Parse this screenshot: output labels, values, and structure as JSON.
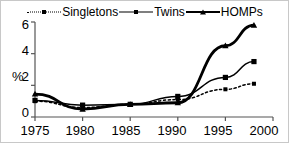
{
  "chart_data": {
    "type": "line",
    "title": "",
    "subtitle": "",
    "xlabel": "",
    "ylabel": "%",
    "x": [
      1975,
      1980,
      1985,
      1990,
      1995,
      1998
    ],
    "xlim": [
      1975,
      2000
    ],
    "ylim": [
      0,
      6
    ],
    "xticks": [
      1975,
      1980,
      1985,
      1990,
      1995,
      2000
    ],
    "yticks": [
      0,
      2,
      4,
      6
    ],
    "grid": false,
    "legend_position": "top-center",
    "series": [
      {
        "name": "Singletons",
        "values": [
          1.0,
          0.6,
          0.8,
          1.1,
          1.75,
          2.1
        ],
        "line_style": "dotted",
        "marker": "square",
        "color": "#000000"
      },
      {
        "name": "Twins",
        "values": [
          1.05,
          0.75,
          0.8,
          1.3,
          2.5,
          3.5
        ],
        "line_style": "solid-thin",
        "marker": "square",
        "color": "#000000"
      },
      {
        "name": "HOMPs",
        "values": [
          1.45,
          0.5,
          0.8,
          0.9,
          4.5,
          5.8
        ],
        "line_style": "solid-thick",
        "marker": "triangle",
        "color": "#000000"
      }
    ]
  },
  "legend": {
    "items": [
      {
        "label": "Singletons",
        "style": "dotted",
        "marker": "square"
      },
      {
        "label": "Twins",
        "style": "solid-thin",
        "marker": "square"
      },
      {
        "label": "HOMPs",
        "style": "solid-thick",
        "marker": "triangle"
      }
    ]
  },
  "axes": {
    "y_label": "%",
    "y_ticks": [
      "0",
      "2",
      "4",
      "6"
    ],
    "x_ticks": [
      "1975",
      "1980",
      "1985",
      "1990",
      "1995",
      "2000"
    ]
  },
  "colors": {
    "ink": "#000000",
    "axis": "#555555",
    "frame": "#c8c8c8",
    "background": "#ffffff"
  }
}
